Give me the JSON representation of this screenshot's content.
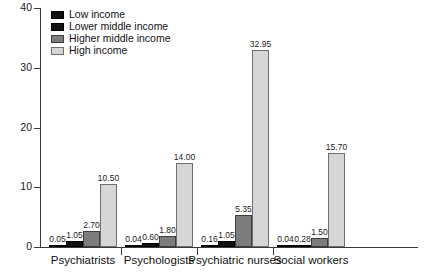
{
  "chart_data": {
    "type": "bar",
    "title": "",
    "subtitle": "",
    "xlabel": "",
    "ylabel": "",
    "ylim": [
      0,
      40
    ],
    "yticks": [
      0,
      10,
      20,
      30,
      40
    ],
    "ytick_labels": [
      "0",
      "10",
      "20",
      "30",
      "40"
    ],
    "grid": false,
    "legend_position": "top-left",
    "categories": [
      "Psychiatrists",
      "Psychologists",
      "Psychiatric nurses",
      "Social workers"
    ],
    "series": [
      {
        "name": "Low income",
        "color": "#101010",
        "values": [
          0.05,
          0.04,
          0.16,
          0.04
        ],
        "labels": [
          "0.05",
          "0.04",
          "0.16",
          "0.04"
        ]
      },
      {
        "name": "Lower middle income",
        "color": "#111111",
        "values": [
          1.05,
          0.6,
          1.05,
          0.28
        ],
        "labels": [
          "1.05",
          "0.60",
          "1.05",
          "0.28"
        ]
      },
      {
        "name": "Higher middle income",
        "color": "#7d7d7d",
        "values": [
          2.7,
          1.8,
          5.35,
          1.5
        ],
        "labels": [
          "2.70",
          "1.80",
          "5.35",
          "1.50"
        ]
      },
      {
        "name": "High income",
        "color": "#d6d6d6",
        "values": [
          10.5,
          14.0,
          32.95,
          15.7
        ],
        "labels": [
          "10.50",
          "14.00",
          "32.95",
          "15.70"
        ]
      }
    ]
  },
  "legend": {
    "items": [
      {
        "label": "Low income"
      },
      {
        "label": "Lower middle income"
      },
      {
        "label": "Higher middle income"
      },
      {
        "label": "High income"
      }
    ]
  },
  "axis": {
    "y_tick_labels": [
      "40",
      "30",
      "20",
      "10",
      "0"
    ]
  }
}
